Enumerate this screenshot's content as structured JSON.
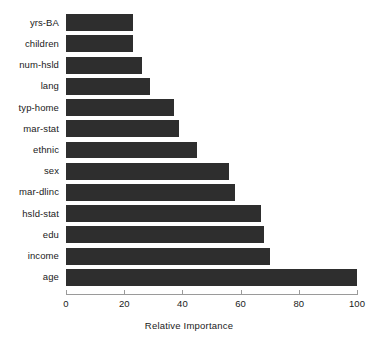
{
  "chart_data": {
    "type": "bar",
    "orientation": "horizontal",
    "title": "",
    "xlabel": "Relative Importance",
    "ylabel": "",
    "xlim": [
      0,
      100
    ],
    "xticks": [
      0,
      20,
      40,
      60,
      80,
      100
    ],
    "grid": false,
    "legend": null,
    "bar_color": "#2e2e2e",
    "categories": [
      "yrs-BA",
      "children",
      "num-hsld",
      "lang",
      "typ-home",
      "mar-stat",
      "ethnic",
      "sex",
      "mar-dlinc",
      "hsld-stat",
      "edu",
      "income",
      "age"
    ],
    "values": [
      23,
      23,
      26,
      29,
      37,
      39,
      45,
      56,
      58,
      67,
      68,
      70,
      100
    ]
  }
}
